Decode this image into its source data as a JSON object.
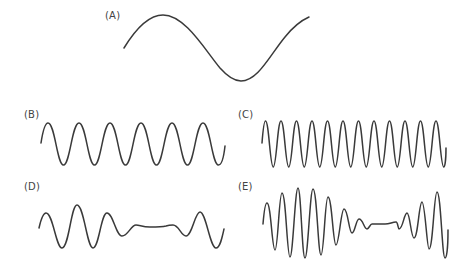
{
  "panels": [
    {
      "label": "(A)",
      "description": "single low-frequency sine wave, one full cycle"
    },
    {
      "label": "(B)",
      "description": "sine wave, six cycles"
    },
    {
      "label": "(C)",
      "description": "higher-frequency sine wave, twelve cycles"
    },
    {
      "label": "(D)",
      "description": "wave with amplitude that collapses in the middle (interference / beat pattern)"
    },
    {
      "label": "(E)",
      "description": "high-frequency beat pattern with amplitude envelope dropping to near zero in the middle"
    }
  ],
  "style": {
    "stroke_color": "#3a3a3a",
    "label_color": "#444444",
    "background": "#ffffff"
  }
}
